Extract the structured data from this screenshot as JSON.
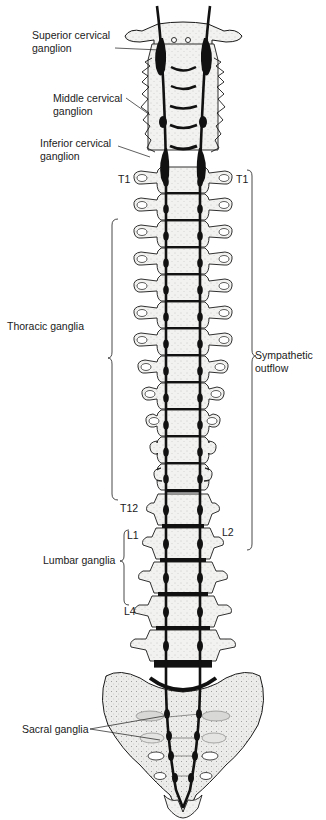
{
  "diagram": {
    "colors": {
      "bone_fill": "#f1f1ef",
      "bone_outline": "#1a1a1a",
      "trunk": "#111111",
      "disc": "#111111",
      "label_text": "#1a1a1a"
    },
    "labels": {
      "superior_cervical": "Superior cervical\nganglion",
      "middle_cervical": "Middle cervical\nganglion",
      "inferior_cervical": "Inferior cervical\nganglion",
      "thoracic": "Thoracic ganglia",
      "lumbar": "Lumbar ganglia",
      "sacral": "Sacral ganglia",
      "sympathetic_outflow": "Sympathetic\noutflow"
    },
    "segment_markers": {
      "t1_left": "T1",
      "t1_right": "T1",
      "t12": "T12",
      "l1": "L1",
      "l2": "L2",
      "l4": "L4"
    },
    "structure": {
      "cervical_vertebrae": 7,
      "thoracic_vertebrae": 12,
      "lumbar_vertebrae": 5,
      "sacrum": 1,
      "sympathetic_trunks": 2,
      "outflow_range": [
        "T1",
        "L2"
      ]
    }
  }
}
